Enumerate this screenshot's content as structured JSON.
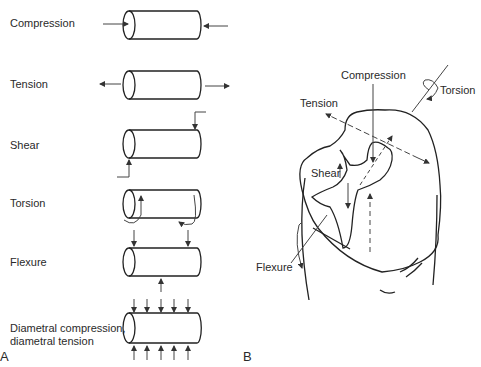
{
  "panel_a": {
    "letter": "A",
    "rows": [
      {
        "label": "Compression"
      },
      {
        "label": "Tension"
      },
      {
        "label": "Shear"
      },
      {
        "label": "Torsion"
      },
      {
        "label": "Flexure"
      },
      {
        "label_line1": "Diametral compression,",
        "label_line2": "diametral tension"
      }
    ]
  },
  "panel_b": {
    "letter": "B",
    "labels": {
      "compression": "Compression",
      "torsion": "Torsion",
      "tension": "Tension",
      "shear": "Shear",
      "flexure": "Flexure"
    }
  }
}
